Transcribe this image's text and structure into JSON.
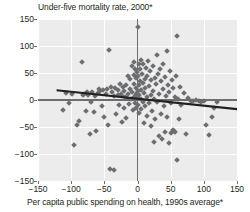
{
  "chart_data": {
    "type": "scatter",
    "title": "Under-five mortality rate, 2000*",
    "xlabel": "Per capita public spending on health, 1990s average*",
    "ylabel": "Under-five mortality rate, 2000*",
    "xlim": [
      -150,
      150
    ],
    "ylim": [
      -150,
      150
    ],
    "xticks": [
      -150,
      -100,
      -50,
      0,
      50,
      100,
      150
    ],
    "yticks": [
      -150,
      -100,
      -50,
      0,
      50,
      100,
      150
    ],
    "xtick_labels": [
      "−150",
      "−100",
      "−50",
      "0",
      "50",
      "100",
      "150"
    ],
    "ytick_labels": [
      "150",
      "100",
      "50",
      "0",
      "−50",
      "−100",
      "−150"
    ],
    "grid": true,
    "grid_color": "#ffffff",
    "plot_background": "#ececec",
    "legend": null,
    "marker_color": "#6c6d70",
    "marker_shape": "diamond",
    "axis_line_color": "#6d6e71",
    "trendline": {
      "label": "linear fit",
      "color": "#231f20",
      "x": [
        -122,
        150
      ],
      "y": [
        18,
        -17
      ],
      "slope": -0.1287,
      "intercept": 2.3
    },
    "zero_lines": {
      "x": 0,
      "y": 0
    },
    "footnote_marker": "*",
    "points": [
      [
        -113,
        -18
      ],
      [
        -108,
        13
      ],
      [
        -103,
        -6
      ],
      [
        -99,
        11
      ],
      [
        -96,
        -83
      ],
      [
        -91,
        -46
      ],
      [
        -88,
        -39
      ],
      [
        -84,
        70
      ],
      [
        -82,
        9
      ],
      [
        -80,
        12
      ],
      [
        -78,
        -20
      ],
      [
        -76,
        14
      ],
      [
        -74,
        10
      ],
      [
        -72,
        -63
      ],
      [
        -70,
        -4
      ],
      [
        -68,
        15
      ],
      [
        -66,
        -22
      ],
      [
        -64,
        8
      ],
      [
        -62,
        -58
      ],
      [
        -60,
        13
      ],
      [
        -58,
        21
      ],
      [
        -56,
        16
      ],
      [
        -54,
        -12
      ],
      [
        -52,
        18
      ],
      [
        -50,
        -31
      ],
      [
        -48,
        11
      ],
      [
        -46,
        20
      ],
      [
        -44,
        -47
      ],
      [
        -43,
        93
      ],
      [
        -42,
        -128
      ],
      [
        -40,
        25
      ],
      [
        -38,
        14
      ],
      [
        -36,
        7
      ],
      [
        -35,
        -129
      ],
      [
        -34,
        22
      ],
      [
        -32,
        -26
      ],
      [
        -30,
        10
      ],
      [
        -29,
        18
      ],
      [
        -28,
        -9
      ],
      [
        -26,
        30
      ],
      [
        -25,
        12
      ],
      [
        -24,
        -41
      ],
      [
        -23,
        8
      ],
      [
        -22,
        24
      ],
      [
        -21,
        -15
      ],
      [
        -20,
        17
      ],
      [
        -19,
        6
      ],
      [
        -18,
        -33
      ],
      [
        -17,
        27
      ],
      [
        -16,
        4
      ],
      [
        -15,
        45
      ],
      [
        -14,
        12
      ],
      [
        -13,
        -8
      ],
      [
        -12,
        20
      ],
      [
        -11,
        38
      ],
      [
        -10,
        2
      ],
      [
        -9,
        63
      ],
      [
        -8,
        15
      ],
      [
        -7,
        -18
      ],
      [
        -6,
        47
      ],
      [
        -6,
        71
      ],
      [
        -5,
        6
      ],
      [
        -5,
        30
      ],
      [
        -4,
        58
      ],
      [
        -4,
        -5
      ],
      [
        -3,
        41
      ],
      [
        -3,
        12
      ],
      [
        -2,
        22
      ],
      [
        -2,
        -14
      ],
      [
        -1,
        8
      ],
      [
        -1,
        52
      ],
      [
        0,
        135
      ],
      [
        0,
        3
      ],
      [
        0,
        17
      ],
      [
        1,
        44
      ],
      [
        1,
        -9
      ],
      [
        2,
        28
      ],
      [
        2,
        66
      ],
      [
        3,
        10
      ],
      [
        3,
        -24
      ],
      [
        4,
        35
      ],
      [
        4,
        57
      ],
      [
        5,
        2
      ],
      [
        5,
        75
      ],
      [
        6,
        19
      ],
      [
        6,
        -17
      ],
      [
        7,
        48
      ],
      [
        8,
        -4
      ],
      [
        8,
        31
      ],
      [
        9,
        67
      ],
      [
        10,
        13
      ],
      [
        10,
        -43
      ],
      [
        11,
        39
      ],
      [
        12,
        -11
      ],
      [
        12,
        23
      ],
      [
        13,
        60
      ],
      [
        14,
        5
      ],
      [
        15,
        -30
      ],
      [
        15,
        44
      ],
      [
        16,
        72
      ],
      [
        17,
        -6
      ],
      [
        18,
        26
      ],
      [
        19,
        54
      ],
      [
        20,
        -48
      ],
      [
        20,
        9
      ],
      [
        21,
        37
      ],
      [
        22,
        -21
      ],
      [
        23,
        63
      ],
      [
        24,
        16
      ],
      [
        25,
        -78
      ],
      [
        25,
        2
      ],
      [
        26,
        41
      ],
      [
        27,
        -35
      ],
      [
        28,
        29
      ],
      [
        29,
        84
      ],
      [
        30,
        -3
      ],
      [
        31,
        49
      ],
      [
        32,
        -66
      ],
      [
        33,
        12
      ],
      [
        34,
        57
      ],
      [
        35,
        -25
      ],
      [
        36,
        35
      ],
      [
        37,
        -72
      ],
      [
        38,
        21
      ],
      [
        39,
        66
      ],
      [
        40,
        -12
      ],
      [
        41,
        42
      ],
      [
        42,
        -59
      ],
      [
        43,
        8
      ],
      [
        44,
        91
      ],
      [
        45,
        -31
      ],
      [
        46,
        27
      ],
      [
        47,
        -80
      ],
      [
        48,
        15
      ],
      [
        49,
        53
      ],
      [
        50,
        -5
      ],
      [
        51,
        -62
      ],
      [
        52,
        37
      ],
      [
        53,
        -56
      ],
      [
        54,
        22
      ],
      [
        55,
        -58
      ],
      [
        56,
        6
      ],
      [
        57,
        -60
      ],
      [
        58,
        45
      ],
      [
        59,
        -111
      ],
      [
        60,
        118
      ],
      [
        61,
        2
      ],
      [
        62,
        -35
      ],
      [
        64,
        24
      ],
      [
        66,
        -9
      ],
      [
        70,
        13
      ],
      [
        73,
        -63
      ],
      [
        76,
        4
      ],
      [
        80,
        -1
      ],
      [
        84,
        -2
      ],
      [
        88,
        0
      ],
      [
        92,
        -1
      ],
      [
        96,
        -3
      ],
      [
        100,
        -2
      ],
      [
        104,
        -46
      ],
      [
        108,
        -64
      ],
      [
        113,
        -32
      ],
      [
        116,
        -15
      ],
      [
        120,
        -4
      ]
    ]
  }
}
